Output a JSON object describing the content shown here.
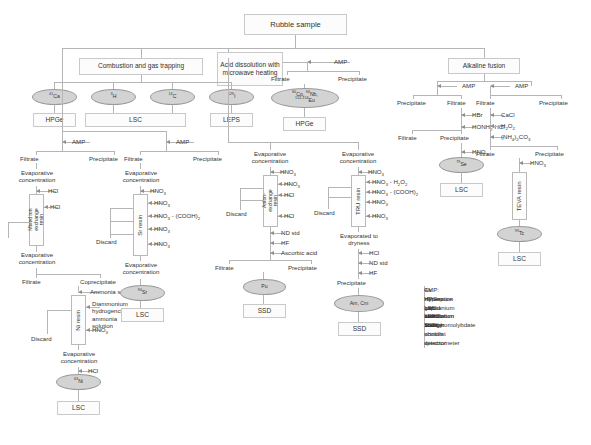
{
  "diagram": {
    "title": "Rubble sample",
    "root": "Rubble sample",
    "branches": {
      "combustion": "Combustion and gas trapping",
      "acid": "Acid dissolution with microwave heating",
      "alkaline": "Alkaline fusion"
    }
  },
  "nuclides": {
    "ca41": "41Ca",
    "h3": "3H",
    "c14": "14C",
    "i129": "129I",
    "hpge_group": "60Co, 94Nb, 152,154Eu",
    "se79": "79Se",
    "tc99": "99Tc",
    "sr90": "90Sr",
    "ni63": "63Ni",
    "pu": "Pu",
    "amcm": "Am, Cm"
  },
  "detectors": {
    "hpge": "HPGe",
    "lsc": "LSC",
    "leps": "LEPS",
    "ssd": "SSD"
  },
  "terms": {
    "amp": "AMP",
    "filtrate": "Filtrate",
    "precipitate": "Precipitate",
    "coprecipitate": "Coprecipitate",
    "discard": "Discard",
    "evap_conc": "Evaporative concentration",
    "evap_dry": "Evaporated to dryness",
    "ammonia_solution": "Ammonia solution",
    "diammonium": "Diammonium hydrogencitrate-ammonia solution",
    "nd_std": "ND std",
    "ascorbic": "Ascorbic acid"
  },
  "reagents": {
    "hcl": "HCl",
    "hno3": "HNO3",
    "hno3_cooh2": "HNO3 - (COOH)2",
    "hno3_h2o2": "HNO3 - H2O2",
    "hf": "HF",
    "hbr": "HBr",
    "honh2hcl": "HONH2-HCl",
    "cacl": "CaCl",
    "h2o2": "H2O2",
    "nh4_2co3": "(NH4)2CO3"
  },
  "resins": {
    "mixed_ion": "Mixed ion exchange resin",
    "sr": "Sr resin",
    "anion": "Anion-exchange resin",
    "tru": "TRU resin",
    "ni": "Ni resin",
    "teva": "TEVA resin"
  },
  "legend": [
    {
      "key": "AMP:",
      "text": "Cs elimination with ammonium phosphomolybdate"
    },
    {
      "key": "HPGe:",
      "text": "Hyperpure germanium detector"
    },
    {
      "key": "LSC:",
      "text": "Liquid scintillation counter"
    },
    {
      "key": "LEPS:",
      "text": "Low energy photon spectrometer"
    },
    {
      "key": "SSD:",
      "text": "Solid scintillat detector"
    }
  ],
  "colors": {
    "ellipse_fill": "#d3d3d3",
    "box_border": "#c9c9c9",
    "line": "#b5b5b5",
    "text": "#333333"
  }
}
